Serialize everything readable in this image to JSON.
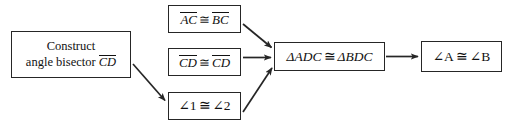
{
  "diagram": {
    "type": "flow-proof",
    "top_clipped_text": "attributes of",
    "colors": {
      "box_border": "#262626",
      "arrow": "#262626",
      "background": "#ffffff",
      "text": "#111111"
    },
    "nodes": [
      {
        "id": "construct",
        "label": "Construct angle bisector CD",
        "line1": "Construct",
        "line2_prefix": "angle bisector",
        "line2_segment": "CD"
      },
      {
        "id": "ac-bc",
        "label": "AC ≅ BC",
        "left_segment": "AC",
        "relation": "≅",
        "right_segment": "BC"
      },
      {
        "id": "cd-cd",
        "label": "CD ≅ CD",
        "left_segment": "CD",
        "relation": "≅",
        "right_segment": "CD"
      },
      {
        "id": "a1-a2",
        "label": "∠1 ≅ ∠2",
        "left_angle": "∠1",
        "relation": "≅",
        "right_angle": "∠2"
      },
      {
        "id": "triangles",
        "label": "ΔADC ≅ ΔBDC",
        "left_triangle": "ΔADC",
        "relation": "≅",
        "right_triangle": "ΔBDC"
      },
      {
        "id": "angles",
        "label": "∠A ≅ ∠B",
        "left_angle": "∠A",
        "relation": "≅",
        "right_angle": "∠B"
      }
    ],
    "edges": [
      {
        "id": "construct-to-a1a2",
        "from": "construct",
        "to": "a1-a2",
        "style": "diagonal-down"
      },
      {
        "id": "acbc-to-triangles",
        "from": "ac-bc",
        "to": "triangles",
        "style": "diagonal-down"
      },
      {
        "id": "cdcd-to-triangles",
        "from": "cd-cd",
        "to": "triangles",
        "style": "horizontal"
      },
      {
        "id": "a1a2-to-triangles",
        "from": "a1-a2",
        "to": "triangles",
        "style": "diagonal-up"
      },
      {
        "id": "triangles-to-angles",
        "from": "triangles",
        "to": "angles",
        "style": "horizontal"
      }
    ]
  }
}
